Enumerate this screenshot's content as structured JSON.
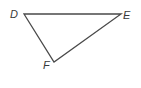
{
  "figure": {
    "type": "triangle",
    "stroke_color": "#4a4a4a",
    "background": "#ffffff",
    "vertices": [
      {
        "label": "D",
        "x": 24,
        "y": 14
      },
      {
        "label": "E",
        "x": 121,
        "y": 14
      },
      {
        "label": "F",
        "x": 54,
        "y": 62
      }
    ],
    "edges": [
      [
        "D",
        "E"
      ],
      [
        "E",
        "F"
      ],
      [
        "F",
        "D"
      ]
    ]
  }
}
